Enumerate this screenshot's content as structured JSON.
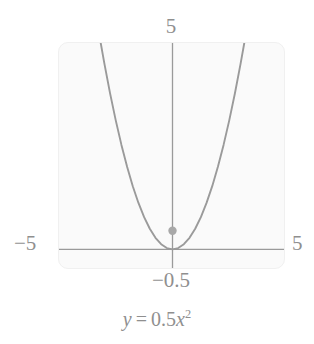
{
  "figure": {
    "caption": {
      "lhs": "y",
      "equals": "=",
      "coefficient": "0.5",
      "variable": "x",
      "exponent": "2",
      "full_text": "y = 0.5x^2"
    },
    "plot": {
      "xmin_label": "−5",
      "xmax_label": "5",
      "ymax_label": "5",
      "ymin_label": "−0.5",
      "curve_color": "#9a9a9a",
      "axis_color": "#9a9a9a",
      "point_color": "#a8a8a8",
      "panel_bg": "#fafafa",
      "panel_border": "#f0f0f0",
      "text_color": "#8f8f8f"
    }
  },
  "chart_data": {
    "type": "line",
    "title": "",
    "subtitle": "",
    "xlabel": "",
    "ylabel": "",
    "equation": "y = 0.5x^2",
    "function": {
      "form": "quadratic",
      "a": 0.5,
      "b": 0,
      "c": 0,
      "vertex": [
        0,
        0
      ]
    },
    "xlim": [
      -5,
      5
    ],
    "ylim": [
      -0.5,
      5
    ],
    "xticks": [
      -5,
      5
    ],
    "yticks": [
      -0.5,
      5
    ],
    "xtick_labels": [
      "−5",
      "5"
    ],
    "ytick_labels": [
      "−0.5",
      "5"
    ],
    "grid": false,
    "legend": null,
    "series": [
      {
        "name": "y = 0.5x^2",
        "color": "#9a9a9a",
        "x": [
          -3.162,
          -3.0,
          -2.75,
          -2.5,
          -2.25,
          -2.0,
          -1.75,
          -1.5,
          -1.25,
          -1.0,
          -0.75,
          -0.5,
          -0.25,
          0.0,
          0.25,
          0.5,
          0.75,
          1.0,
          1.25,
          1.5,
          1.75,
          2.0,
          2.25,
          2.5,
          2.75,
          3.0,
          3.162
        ],
        "y": [
          5.0,
          4.5,
          3.781,
          3.125,
          2.531,
          2.0,
          1.531,
          1.125,
          0.781,
          0.5,
          0.281,
          0.125,
          0.031,
          0.0,
          0.031,
          0.125,
          0.281,
          0.5,
          0.781,
          1.125,
          1.531,
          2.0,
          2.531,
          3.125,
          3.781,
          4.5,
          5.0
        ]
      }
    ],
    "annotations": [
      {
        "type": "point",
        "name": "marked-point",
        "x": 0,
        "y": 0.45,
        "color": "#a8a8a8",
        "label": ""
      }
    ]
  }
}
